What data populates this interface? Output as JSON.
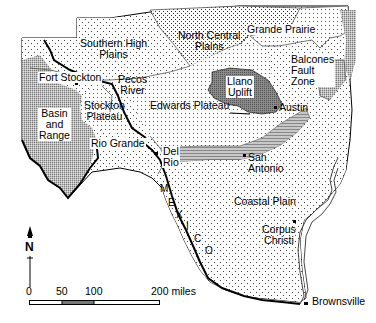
{
  "map": {
    "subject": "Physiographic regions of Texas",
    "regions": [
      {
        "id": "southern-high-plains",
        "label_lines": [
          "Southern High",
          "Plains"
        ]
      },
      {
        "id": "north-central-plains",
        "label_lines": [
          "North Central",
          "Plains"
        ]
      },
      {
        "id": "grande-prairie",
        "label_lines": [
          "Grande Prairie"
        ]
      },
      {
        "id": "llano-uplift",
        "label_lines": [
          "Llano",
          "Uplift"
        ]
      },
      {
        "id": "balcones-fault-zone",
        "label_lines": [
          "Balcones",
          "Fault",
          "Zone"
        ]
      },
      {
        "id": "edwards-plateau",
        "label_lines": [
          "Edwards Plateau"
        ]
      },
      {
        "id": "pecos-river",
        "label_lines": [
          "Pecos",
          "River"
        ]
      },
      {
        "id": "stockton-plateau",
        "label_lines": [
          "Stockton",
          "Plateau"
        ]
      },
      {
        "id": "basin-and-range",
        "label_lines": [
          "Basin",
          "and",
          "Range"
        ]
      },
      {
        "id": "coastal-plain",
        "label_lines": [
          "Coastal Plain"
        ]
      }
    ],
    "rivers": [
      {
        "id": "rio-grande",
        "label": "Rio Grande"
      }
    ],
    "cities": [
      {
        "id": "fort-stockton",
        "label": "Fort Stockton"
      },
      {
        "id": "austin",
        "label": "Austin"
      },
      {
        "id": "del-rio",
        "label_lines": [
          "Del",
          "Rio"
        ]
      },
      {
        "id": "san-antonio",
        "label_lines": [
          "San",
          "Antonio"
        ]
      },
      {
        "id": "corpus-christi",
        "label_lines": [
          "Corpus",
          "Christi"
        ]
      },
      {
        "id": "brownsville",
        "label": "Brownsville"
      }
    ],
    "country_label_letters": [
      "M",
      "E",
      "X",
      "I",
      "C",
      "O"
    ],
    "north_arrow": {
      "label": "N"
    },
    "scale_bar": {
      "ticks": [
        "0",
        "50",
        "100",
        "200 miles"
      ]
    }
  }
}
